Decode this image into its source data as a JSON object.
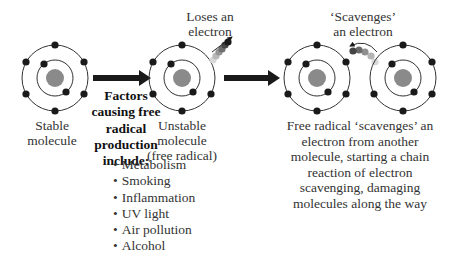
{
  "labels": {
    "stable_molecule": [
      "Stable",
      "molecule"
    ],
    "factors_heading": [
      "Factors",
      "causing free",
      "radical",
      "production",
      "include:"
    ],
    "unstable_molecule": [
      "Unstable",
      "molecule",
      "(free radical)"
    ],
    "loses_electron": [
      "Loses an",
      "electron"
    ],
    "scavenges_electron": [
      "‘Scavenges’",
      "an electron"
    ],
    "description": [
      "Free radical ‘scavenges’ an",
      "electron from another",
      "molecule, starting a chain",
      "reaction of electron",
      "scavenging, damaging",
      "molecules along the way"
    ]
  },
  "factors": [
    "Metabolism",
    "Smoking",
    "Inflammation",
    "UV light",
    "Air pollution",
    "Alcohol"
  ],
  "colors": {
    "electron": "#1a1a1a",
    "nucleus": "#8a8a8a",
    "orbit": "#333333",
    "arrow": "#1a1a1a",
    "trail": [
      "#cccccc",
      "#a8a8a8",
      "#888888",
      "#606060",
      "#3a3a3a",
      "#1a1a1a"
    ]
  }
}
